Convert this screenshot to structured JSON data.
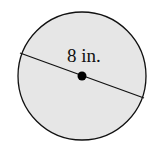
{
  "diagram": {
    "shape": "circle",
    "measurement": "diameter",
    "label": "8 in.",
    "fill_color": "#e6e6e6",
    "stroke_color": "#111111"
  }
}
